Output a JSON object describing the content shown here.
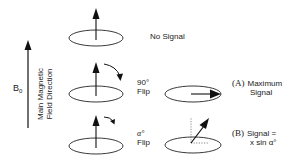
{
  "axis": {
    "symbol": "B",
    "subscript": "0",
    "label_line1": "Main Magnetic",
    "label_line2": "Field Direction"
  },
  "rows": [
    {
      "id": "rest",
      "caption": "No Signal"
    },
    {
      "id": "flip90",
      "angle": "90°",
      "flip_word": "Flip"
    },
    {
      "id": "flip_alpha",
      "angle": "α°",
      "flip_word": "Flip"
    }
  ],
  "results": [
    {
      "id": "A",
      "tag": "(A)",
      "line1": "Maximum",
      "line2": "Signal"
    },
    {
      "id": "B",
      "tag": "(B)",
      "line1": "Signal =",
      "line2": "x sin α°"
    }
  ],
  "colors": {
    "stroke": "#1a1a1a",
    "background": "#ffffff"
  }
}
